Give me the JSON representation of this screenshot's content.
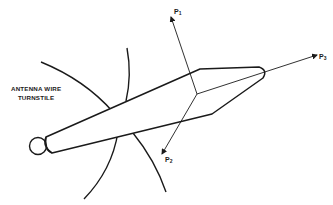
{
  "diagram": {
    "title_lines": [
      "ANTENNA WIRE",
      "TURNSTILE"
    ],
    "vectors": [
      {
        "name": "P",
        "subscript": "1"
      },
      {
        "name": "P",
        "subscript": "2"
      },
      {
        "name": "P",
        "subscript": "3"
      }
    ],
    "colors": {
      "line": "#1a1a1a",
      "background": "#ffffff"
    }
  }
}
